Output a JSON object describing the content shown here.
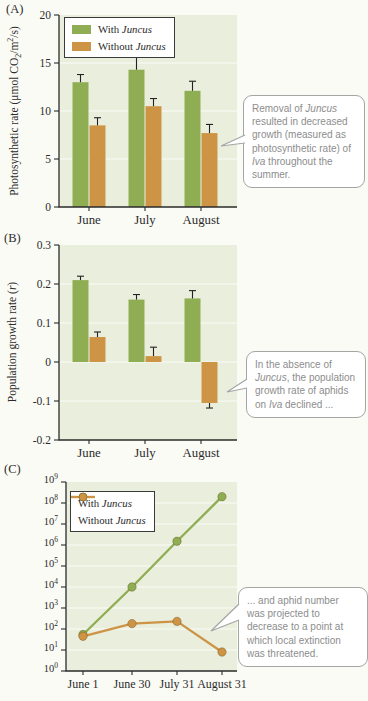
{
  "colors": {
    "with_juncus": "#8fad52",
    "without_juncus": "#cd9446",
    "plot_bg": "#eaeedd",
    "axis": "#2b2b2b",
    "error_bar": "#222222",
    "gridline": "rgba(255,255,255,0.8)",
    "callout_text": "#8d8d8d",
    "callout_border": "#a5a5a5",
    "marker_edge": "rgba(90,60,10,0.35)"
  },
  "panel_labels": [
    "(A)",
    "(B)",
    "(C)"
  ],
  "chart_data": [
    {
      "type": "bar",
      "panel": "A",
      "ylabel": "Photosynthetic rate (μmol CO2/m2/s)",
      "ylabel_rich": [
        {
          "t": "Photosynthetic rate (μmol CO"
        },
        {
          "t": "2",
          "sub": true
        },
        {
          "t": "/m"
        },
        {
          "t": "2",
          "sup": true
        },
        {
          "t": "/s)"
        }
      ],
      "categories": [
        "June",
        "July",
        "August"
      ],
      "ylim": [
        0,
        20
      ],
      "ytick_values": [
        0,
        5,
        10,
        15,
        20
      ],
      "ytick_labels": [
        "0",
        "5",
        "10",
        "15",
        "20"
      ],
      "gridline_values": [
        5,
        10,
        15
      ],
      "legend_position": "top-left",
      "grid": "subtle-white",
      "series": [
        {
          "name": "With Juncus",
          "name_rich": [
            {
              "t": "With "
            },
            {
              "t": "Juncus",
              "i": true
            }
          ],
          "color_key": "with_juncus",
          "values": [
            13.0,
            14.3,
            12.1
          ],
          "errors": [
            0.8,
            1.4,
            1.0
          ]
        },
        {
          "name": "Without Juncus",
          "name_rich": [
            {
              "t": "Without "
            },
            {
              "t": "Juncus",
              "i": true
            }
          ],
          "color_key": "without_juncus",
          "values": [
            8.5,
            10.5,
            7.7
          ],
          "errors": [
            0.8,
            0.8,
            0.9
          ]
        }
      ]
    },
    {
      "type": "bar",
      "panel": "B",
      "ylabel": "Population growth rate (r)",
      "ylabel_rich": [
        {
          "t": "Population growth rate ("
        },
        {
          "t": "r",
          "i": true
        },
        {
          "t": ")"
        }
      ],
      "categories": [
        "June",
        "July",
        "August"
      ],
      "ylim": [
        -0.2,
        0.3
      ],
      "ytick_values": [
        0.3,
        0.2,
        0.1,
        0,
        -0.1,
        -0.2
      ],
      "ytick_labels": [
        "0.3",
        "0.2",
        "0.1",
        "0",
        "-0.1",
        "-0.2"
      ],
      "gridline_values": [
        0.2,
        0.1,
        0,
        -0.1
      ],
      "grid": "subtle-white",
      "series": [
        {
          "name": "With Juncus",
          "name_rich": [
            {
              "t": "With "
            },
            {
              "t": "Juncus",
              "i": true
            }
          ],
          "color_key": "with_juncus",
          "values": [
            0.21,
            0.16,
            0.163
          ],
          "errors": [
            0.01,
            0.013,
            0.02
          ]
        },
        {
          "name": "Without Juncus",
          "name_rich": [
            {
              "t": "Without "
            },
            {
              "t": "Juncus",
              "i": true
            }
          ],
          "color_key": "without_juncus",
          "values": [
            0.064,
            0.015,
            -0.105
          ],
          "errors": [
            0.013,
            0.023,
            0.013
          ]
        }
      ]
    },
    {
      "type": "line",
      "panel": "C",
      "ylabel": "Number of aphids",
      "yscale": "log",
      "ylim": [
        1,
        1000000000
      ],
      "y_tick_exponents": [
        9,
        8,
        7,
        6,
        5,
        4,
        3,
        2,
        1,
        0
      ],
      "categories": [
        "June 1",
        "June 30",
        "July 31",
        "August 31"
      ],
      "legend_position": "top-left",
      "grid": "subtle-white",
      "series": [
        {
          "name": "With Juncus",
          "name_rich": [
            {
              "t": "With "
            },
            {
              "t": "Juncus",
              "i": true
            }
          ],
          "color_key": "with_juncus",
          "values": [
            55,
            10000,
            1500000,
            200000000
          ]
        },
        {
          "name": "Without Juncus",
          "name_rich": [
            {
              "t": "Without "
            },
            {
              "t": "Juncus",
              "i": true
            }
          ],
          "color_key": "without_juncus",
          "values": [
            45,
            180,
            230,
            8
          ]
        }
      ]
    }
  ],
  "callouts": [
    {
      "panel": "A",
      "text": "Removal of Juncus resulted in decreased growth (measured as photosynthetic rate) of Iva throughout the summer.",
      "rich": [
        {
          "t": "Removal of "
        },
        {
          "t": "Juncus",
          "i": true
        },
        {
          "t": " resulted in decreased growth (measured as photosynthetic rate) of "
        },
        {
          "t": "Iva",
          "i": true
        },
        {
          "t": " throughout the summer."
        }
      ]
    },
    {
      "panel": "B",
      "text": "In the absence of Juncus, the population growth rate of aphids on Iva declined ...",
      "rich": [
        {
          "t": "In the absence of "
        },
        {
          "t": "Juncus",
          "i": true
        },
        {
          "t": ", the population growth rate of aphids on "
        },
        {
          "t": "Iva",
          "i": true
        },
        {
          "t": " declined ..."
        }
      ]
    },
    {
      "panel": "C",
      "text": "... and aphid number was projected to decrease to a point at which local extinction was threatened.",
      "rich": [
        {
          "t": "... and aphid number was projected to decrease to a point at which local extinction was threatened."
        }
      ]
    }
  ]
}
